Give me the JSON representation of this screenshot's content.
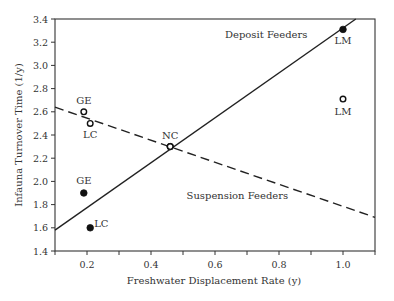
{
  "chart_data": {
    "type": "scatter",
    "title": "",
    "xlabel": "Freshwater Displacement Rate (y)",
    "ylabel": "Infauna Turnover Time (1/y)",
    "xlim": [
      0.1,
      1.1
    ],
    "ylim": [
      1.4,
      3.4
    ],
    "xticks": [
      0.2,
      0.4,
      0.6,
      0.8,
      1.0
    ],
    "xtick_labels": [
      "0.2",
      "0.4",
      "0.6",
      "0.8",
      "1.0"
    ],
    "x_minor_ticks": [
      0.1,
      0.2,
      0.3,
      0.4,
      0.5,
      0.6,
      0.7,
      0.8,
      0.9,
      1.0,
      1.1
    ],
    "yticks": [
      1.4,
      1.6,
      1.8,
      2.0,
      2.2,
      2.4,
      2.6,
      2.8,
      3.0,
      3.2,
      3.4
    ],
    "ytick_labels": [
      "1.4",
      "1.6",
      "1.8",
      "2.0",
      "2.2",
      "2.4",
      "2.6",
      "2.8",
      "3.0",
      "3.2",
      "3.4"
    ],
    "grid": false,
    "legend": "none (inline annotations)",
    "series": [
      {
        "name": "Deposit Feeders",
        "marker": "filled-circle",
        "points": [
          {
            "label": "GE",
            "x": 0.19,
            "y": 1.9
          },
          {
            "label": "LC",
            "x": 0.21,
            "y": 1.6
          },
          {
            "label": "NC",
            "x": 0.46,
            "y": 2.3
          },
          {
            "label": "LM",
            "x": 1.0,
            "y": 3.31
          }
        ],
        "fit_line": {
          "style": "solid",
          "x": [
            0.1,
            1.04
          ],
          "y": [
            1.58,
            3.4
          ]
        }
      },
      {
        "name": "Suspension Feeders",
        "marker": "open-circle",
        "points": [
          {
            "label": "GE",
            "x": 0.19,
            "y": 2.6
          },
          {
            "label": "LC",
            "x": 0.21,
            "y": 2.5
          },
          {
            "label": "NC",
            "x": 0.46,
            "y": 2.3
          },
          {
            "label": "LM",
            "x": 1.0,
            "y": 2.71
          }
        ],
        "fit_line": {
          "style": "dashed",
          "x": [
            0.1,
            1.1
          ],
          "y": [
            2.64,
            1.69
          ]
        }
      }
    ],
    "annotations": [
      {
        "text": "Deposit Feeders",
        "x": 0.76,
        "y": 3.24
      },
      {
        "text": "Suspension Feeders",
        "x": 0.67,
        "y": 1.85
      }
    ]
  },
  "labels": {
    "xlabel": "Freshwater Displacement Rate (y)",
    "ylabel": "Infauna Turnover Time (1/y)",
    "deposit": "Deposit Feeders",
    "suspension": "Suspension Feeders"
  },
  "colors": {
    "axis": "#333333",
    "line": "#222222",
    "marker": "#111111",
    "background": "#ffffff"
  }
}
